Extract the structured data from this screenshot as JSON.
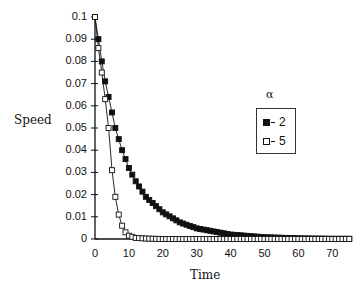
{
  "chart_data": {
    "type": "line",
    "title": "",
    "xlabel": "Time",
    "ylabel": "Speed",
    "xlim": [
      0,
      75
    ],
    "ylim": [
      0,
      0.1
    ],
    "x_ticks": [
      "0",
      "10",
      "20",
      "30",
      "40",
      "50",
      "60",
      "70"
    ],
    "y_ticks": [
      "0",
      "0.01",
      "0.02",
      "0.03",
      "0.04",
      "0.05",
      "0.06",
      "0.07",
      "0.08",
      "0.09",
      "0.1"
    ],
    "legend_title": "α",
    "legend_position": "right",
    "grid": false,
    "series": [
      {
        "name": "2",
        "marker": "filled-square",
        "decay_rate": 0.1,
        "note": "exponential decay from 0.1, approx 0.0905 at t=1, 0.061 at t=5, 0.037 at t=10, 0.0135 at t=20, 0.005 at t=30, ~0 by t=45"
      },
      {
        "name": "5",
        "marker": "open-square",
        "decay_rate": 0.4,
        "note": "exponential decay from 0.1, approx 0.075 at t=2, 0.05 at t=4, 0.03 at t=5, 0.019 at t=6, 0.011 at t=7, ~0 by t=10"
      }
    ],
    "x": [
      0,
      1,
      2,
      3,
      4,
      5,
      6,
      7,
      8,
      9,
      10,
      12,
      15,
      20,
      25,
      30,
      40,
      50,
      60,
      70,
      75
    ],
    "values_by_series": {
      "2": [
        0.1,
        0.09,
        0.08,
        0.071,
        0.064,
        0.057,
        0.05,
        0.045,
        0.04,
        0.036,
        0.032,
        0.026,
        0.019,
        0.012,
        0.0075,
        0.0048,
        0.002,
        0.0008,
        0.0003,
        0.0001,
        0.0001
      ],
      "5": [
        0.1,
        0.086,
        0.075,
        0.063,
        0.05,
        0.031,
        0.019,
        0.011,
        0.006,
        0.003,
        0.0015,
        0.0005,
        0.0002,
        0,
        0,
        0,
        0,
        0,
        0,
        0,
        0
      ]
    }
  },
  "legend": {
    "title": "α",
    "items": [
      {
        "label": "2",
        "marker": "filled"
      },
      {
        "label": "5",
        "marker": "open"
      }
    ]
  },
  "axes": {
    "xlabel": "Time",
    "ylabel": "Speed"
  }
}
